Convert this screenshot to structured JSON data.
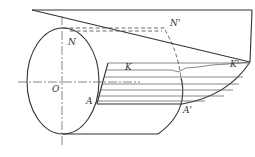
{
  "diagram": {
    "type": "cylinder-plane-intersection",
    "labels": {
      "N": "N",
      "N_prime": "N'",
      "K": "K",
      "K_prime": "K'",
      "O": "O",
      "A": "A",
      "A_prime": "A'"
    },
    "colors": {
      "line": "#333333",
      "hatch": "#555555",
      "background": "#ffffff"
    }
  }
}
